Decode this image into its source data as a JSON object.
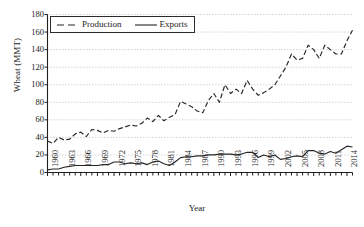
{
  "chart_data": {
    "type": "line",
    "title": "",
    "xlabel": "Year",
    "ylabel": "Wheat (MMT)",
    "xlim": [
      1960,
      2015
    ],
    "ylim": [
      0,
      180
    ],
    "ytick_labels": [
      "0",
      "20",
      "40",
      "60",
      "80",
      "100",
      "120",
      "140",
      "160",
      "180"
    ],
    "ytick_values": [
      0,
      20,
      40,
      60,
      80,
      100,
      120,
      140,
      160,
      180
    ],
    "xtick_labels": [
      "1960",
      "1963",
      "1966",
      "1969",
      "1972",
      "1975",
      "1978",
      "1981",
      "1984",
      "1987",
      "1990",
      "1993",
      "1996",
      "1999",
      "2002",
      "2005",
      "2008",
      "2011",
      "2014"
    ],
    "xtick_values": [
      1960,
      1963,
      1966,
      1969,
      1972,
      1975,
      1978,
      1981,
      1984,
      1987,
      1990,
      1993,
      1996,
      1999,
      2002,
      2005,
      2008,
      2011,
      2014
    ],
    "grid": "horizontal-dotted",
    "legend_position": "top-left",
    "x": [
      1960,
      1961,
      1962,
      1963,
      1964,
      1965,
      1966,
      1967,
      1968,
      1969,
      1970,
      1971,
      1972,
      1973,
      1974,
      1975,
      1976,
      1977,
      1978,
      1979,
      1980,
      1981,
      1982,
      1983,
      1984,
      1985,
      1986,
      1987,
      1988,
      1989,
      1990,
      1991,
      1992,
      1993,
      1994,
      1995,
      1996,
      1997,
      1998,
      1999,
      2000,
      2001,
      2002,
      2003,
      2004,
      2005,
      2006,
      2007,
      2008,
      2009,
      2010,
      2011,
      2012,
      2013,
      2014,
      2015
    ],
    "series": [
      {
        "name": "Production",
        "style": "dashed",
        "color": "#262626",
        "values": [
          36,
          33,
          40,
          37,
          38,
          44,
          46,
          41,
          49,
          48,
          45,
          48,
          47,
          50,
          52,
          54,
          53,
          56,
          62,
          58,
          65,
          59,
          63,
          66,
          81,
          78,
          75,
          70,
          68,
          82,
          90,
          80,
          100,
          90,
          95,
          90,
          105,
          95,
          88,
          91,
          95,
          100,
          110,
          120,
          135,
          128,
          130,
          145,
          140,
          130,
          145,
          140,
          135,
          135,
          150,
          162
        ]
      },
      {
        "name": "Exports",
        "style": "solid",
        "color": "#262626",
        "values": [
          3,
          4,
          4,
          6,
          7,
          8,
          8,
          8,
          8,
          8,
          9,
          9,
          12,
          12,
          10,
          11,
          10,
          11,
          9,
          12,
          13,
          10,
          8,
          12,
          17,
          18,
          18,
          19,
          19,
          20,
          20,
          21,
          21,
          21,
          20,
          21,
          23,
          23,
          17,
          20,
          18,
          20,
          15,
          16,
          18,
          19,
          18,
          25,
          25,
          22,
          21,
          24,
          22,
          26,
          30,
          29
        ]
      }
    ]
  }
}
